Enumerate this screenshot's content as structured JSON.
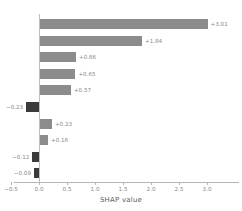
{
  "chart_data": {
    "type": "bar",
    "orientation": "horizontal",
    "title": "",
    "subtitle": "",
    "xlabel": "SHAP value",
    "ylabel": "",
    "xlim": [
      -0.5,
      3.3
    ],
    "ylim": [
      0,
      10
    ],
    "grid": false,
    "legend": null,
    "legend_position": "none",
    "zero_reference_line": 0.0,
    "xticks": [
      -0.5,
      0.0,
      0.5,
      1.0,
      1.5,
      2.0,
      2.5,
      3.0
    ],
    "xticklabels": [
      "−0.5",
      "0.0",
      "0.5",
      "1.0",
      "1.5",
      "2.0",
      "2.5",
      "3.0"
    ],
    "categories": [
      "",
      "",
      "",
      "",
      "",
      "",
      "",
      "",
      "",
      ""
    ],
    "values": [
      3.01,
      1.84,
      0.66,
      0.65,
      0.57,
      -0.23,
      0.23,
      0.16,
      -0.12,
      -0.09
    ],
    "data_labels": [
      "+3.01",
      "+1.84",
      "+0.66",
      "+0.65",
      "+0.57",
      "−0.23",
      "+0.23",
      "+0.16",
      "−0.12",
      "−0.09"
    ],
    "bars": [
      {
        "index": 0,
        "value": 3.01,
        "label": "+3.01",
        "sign": "positive"
      },
      {
        "index": 1,
        "value": 1.84,
        "label": "+1.84",
        "sign": "positive"
      },
      {
        "index": 2,
        "value": 0.66,
        "label": "+0.66",
        "sign": "positive"
      },
      {
        "index": 3,
        "value": 0.65,
        "label": "+0.65",
        "sign": "positive"
      },
      {
        "index": 4,
        "value": 0.57,
        "label": "+0.57",
        "sign": "positive"
      },
      {
        "index": 5,
        "value": -0.23,
        "label": "−0.23",
        "sign": "negative"
      },
      {
        "index": 6,
        "value": 0.23,
        "label": "+0.23",
        "sign": "positive"
      },
      {
        "index": 7,
        "value": 0.16,
        "label": "+0.16",
        "sign": "positive"
      },
      {
        "index": 8,
        "value": -0.12,
        "label": "−0.12",
        "sign": "negative"
      },
      {
        "index": 9,
        "value": -0.09,
        "label": "−0.09",
        "sign": "negative"
      }
    ],
    "colors": {
      "positive_bar": "#8c8c8c",
      "negative_bar": "#3b3b3b",
      "label_text": "#8a8a8a",
      "axis_line": "#b5b5b5",
      "zero_line": "#bfbfbf",
      "axis_title": "#5c5c5c",
      "background": "#ffffff"
    }
  }
}
